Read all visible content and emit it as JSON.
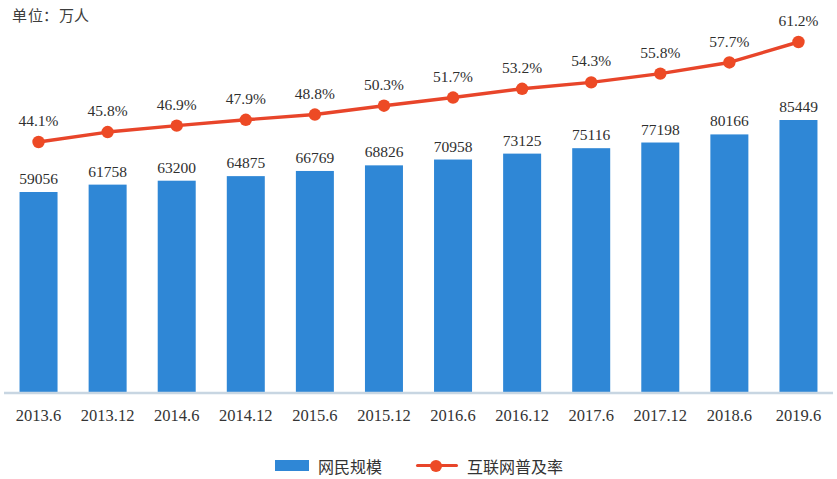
{
  "unit_caption": "单位：万人",
  "colors": {
    "bar": "#2f87d6",
    "line": "#e8452a",
    "marker": "#ed4a25",
    "axis": "#c8d6e2",
    "label_text": "#2f2f2f"
  },
  "legend": {
    "items": [
      {
        "label": "网民规模",
        "type": "bar",
        "color": "#2f87d6"
      },
      {
        "label": "互联网普及率",
        "type": "line",
        "color": "#e8452a"
      }
    ]
  },
  "chart_data": {
    "type": "bar",
    "title": "",
    "subtitle": "",
    "xlabel": "",
    "ylabel": "单位：万人",
    "grid": false,
    "legend_position": "bottom",
    "categories": [
      "2013.6",
      "2013.12",
      "2014.6",
      "2014.12",
      "2015.6",
      "2015.12",
      "2016.6",
      "2016.12",
      "2017.6",
      "2017.12",
      "2018.6",
      "2019.6"
    ],
    "series": [
      {
        "name": "网民规模",
        "type": "bar",
        "unit": "万人",
        "color": "#2f87d6",
        "values": [
          59056,
          61758,
          63200,
          64875,
          66769,
          68826,
          70958,
          73125,
          75116,
          77198,
          80166,
          85449
        ],
        "labels": [
          "59056",
          "61758",
          "63200",
          "64875",
          "66769",
          "68826",
          "70958",
          "73125",
          "75116",
          "77198",
          "80166",
          "85449"
        ],
        "ylim": [
          0,
          92000
        ]
      },
      {
        "name": "互联网普及率",
        "type": "line",
        "unit": "%",
        "color": "#e8452a",
        "values": [
          44.1,
          45.8,
          46.9,
          47.9,
          48.8,
          50.3,
          51.7,
          53.2,
          54.3,
          55.8,
          57.7,
          61.2
        ],
        "labels": [
          "44.1%",
          "45.8%",
          "46.9%",
          "47.9%",
          "48.8%",
          "50.3%",
          "51.7%",
          "53.2%",
          "54.3%",
          "55.8%",
          "57.7%",
          "61.2%"
        ],
        "ylim": [
          40,
          64
        ]
      }
    ]
  }
}
